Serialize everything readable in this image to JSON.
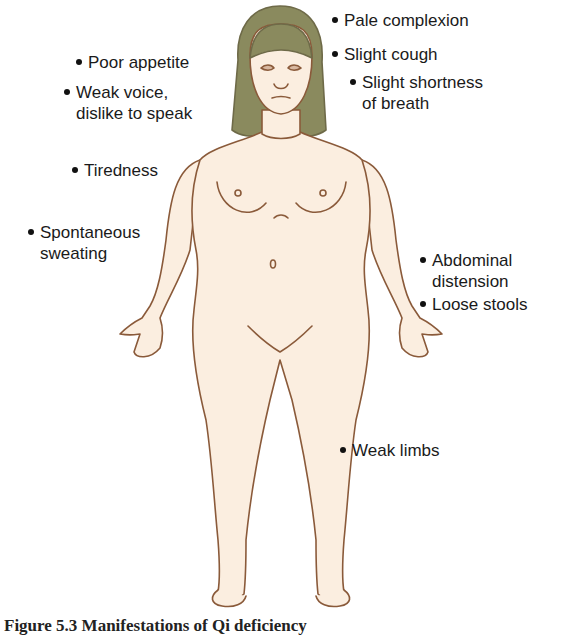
{
  "figure": {
    "colors": {
      "skin": "#fbeee0",
      "outline": "#8a5a3a",
      "hair": "#8a8a5e",
      "text": "#1a1a1a"
    }
  },
  "labels": {
    "poor_appetite": {
      "line1": "Poor appetite"
    },
    "weak_voice": {
      "line1": "Weak voice,",
      "line2": "dislike to speak"
    },
    "tiredness": {
      "line1": "Tiredness"
    },
    "spontaneous_sweating": {
      "line1": "Spontaneous",
      "line2": "sweating"
    },
    "pale_complexion": {
      "line1": "Pale complexion"
    },
    "slight_cough": {
      "line1": "Slight cough"
    },
    "shortness_of_breath": {
      "line1": "Slight shortness",
      "line2": "of breath"
    },
    "abdominal_distension": {
      "line1": "Abdominal",
      "line2": "distension"
    },
    "loose_stools": {
      "line1": "Loose stools"
    },
    "weak_limbs": {
      "line1": "Weak limbs"
    }
  },
  "caption": {
    "text": "Figure 5.3  Manifestations of Qi deficiency"
  }
}
